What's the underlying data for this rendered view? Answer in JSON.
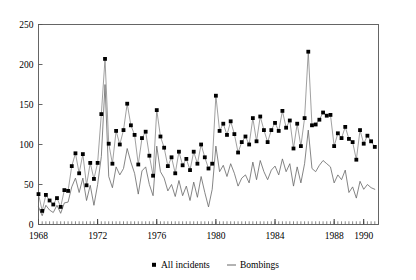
{
  "chart_data": {
    "type": "line",
    "title": "",
    "xlabel": "",
    "ylabel": "",
    "xlim": [
      1968,
      1991
    ],
    "ylim": [
      0,
      250
    ],
    "grid": false,
    "legend_position": "bottom-center",
    "x_tick_labels": [
      "1968",
      "1972",
      "1976",
      "1980",
      "1984",
      "1988",
      "1990"
    ],
    "x_tick_values": [
      1968,
      1972,
      1976,
      1980,
      1984,
      1988,
      1990
    ],
    "y_tick_labels": [
      "0",
      "50",
      "100",
      "150",
      "200",
      "250"
    ],
    "y_tick_values": [
      0,
      50,
      100,
      150,
      200,
      250
    ],
    "minor_tick_interval_years": 0.25,
    "x": [
      1968.0,
      1968.25,
      1968.5,
      1968.75,
      1969.0,
      1969.25,
      1969.5,
      1969.75,
      1970.0,
      1970.25,
      1970.5,
      1970.75,
      1971.0,
      1971.25,
      1971.5,
      1971.75,
      1972.0,
      1972.25,
      1972.5,
      1972.75,
      1973.0,
      1973.25,
      1973.5,
      1973.75,
      1974.0,
      1974.25,
      1974.5,
      1974.75,
      1975.0,
      1975.25,
      1975.5,
      1975.75,
      1976.0,
      1976.25,
      1976.5,
      1976.75,
      1977.0,
      1977.25,
      1977.5,
      1977.75,
      1978.0,
      1978.25,
      1978.5,
      1978.75,
      1979.0,
      1979.25,
      1979.5,
      1979.75,
      1980.0,
      1980.25,
      1980.5,
      1980.75,
      1981.0,
      1981.25,
      1981.5,
      1981.75,
      1982.0,
      1982.25,
      1982.5,
      1982.75,
      1983.0,
      1983.25,
      1983.5,
      1983.75,
      1984.0,
      1984.25,
      1984.5,
      1984.75,
      1985.0,
      1985.25,
      1985.5,
      1985.75,
      1986.0,
      1986.25,
      1986.5,
      1986.75,
      1987.0,
      1987.25,
      1987.5,
      1987.75,
      1988.0,
      1988.25,
      1988.5,
      1988.75,
      1989.0,
      1989.25,
      1989.5,
      1989.75,
      1990.0,
      1990.25,
      1990.5,
      1990.75
    ],
    "series": [
      {
        "name": "All incidents",
        "style": "markers-and-line",
        "marker": "square",
        "color": "#000000",
        "values": [
          38,
          17,
          37,
          30,
          25,
          33,
          22,
          43,
          42,
          73,
          89,
          64,
          88,
          49,
          77,
          57,
          77,
          138,
          207,
          101,
          76,
          117,
          100,
          118,
          151,
          124,
          112,
          75,
          108,
          116,
          86,
          61,
          143,
          110,
          96,
          73,
          84,
          64,
          91,
          74,
          82,
          68,
          91,
          76,
          100,
          84,
          70,
          76,
          161,
          117,
          126,
          112,
          129,
          113,
          90,
          103,
          110,
          100,
          133,
          104,
          135,
          118,
          103,
          118,
          127,
          117,
          142,
          121,
          130,
          95,
          126,
          98,
          133,
          216,
          124,
          125,
          131,
          140,
          136,
          137,
          98,
          114,
          108,
          122,
          107,
          103,
          81,
          118,
          101,
          111,
          104,
          97
        ]
      },
      {
        "name": "Bombings",
        "style": "line",
        "color": "#666666",
        "values": [
          22,
          11,
          24,
          18,
          15,
          24,
          14,
          27,
          28,
          47,
          58,
          40,
          58,
          30,
          49,
          24,
          50,
          85,
          175,
          60,
          46,
          72,
          62,
          70,
          95,
          78,
          64,
          38,
          67,
          72,
          50,
          36,
          98,
          66,
          58,
          42,
          50,
          35,
          55,
          36,
          48,
          30,
          53,
          34,
          60,
          40,
          22,
          44,
          98,
          66,
          74,
          60,
          76,
          64,
          48,
          58,
          62,
          52,
          78,
          56,
          80,
          66,
          56,
          68,
          73,
          62,
          82,
          66,
          76,
          48,
          72,
          52,
          76,
          118,
          70,
          66,
          74,
          80,
          76,
          72,
          52,
          62,
          56,
          68,
          40,
          47,
          33,
          54,
          44,
          50,
          46,
          44
        ]
      }
    ]
  },
  "legend": {
    "items": [
      {
        "label": "All incidents",
        "symbol": "square-marker"
      },
      {
        "label": "Bombings",
        "symbol": "line-dash"
      }
    ]
  }
}
